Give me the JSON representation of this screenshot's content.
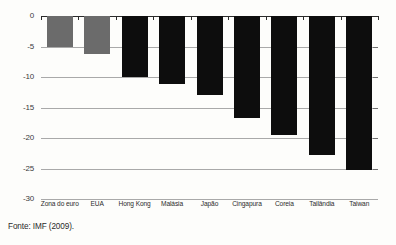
{
  "chart_data": {
    "type": "bar",
    "title": "",
    "subtitle": "",
    "xlabel": "",
    "ylabel": "",
    "ylim": [
      -30,
      0
    ],
    "yticks": [
      0,
      -5,
      -10,
      -15,
      -20,
      -25,
      -30
    ],
    "ytick_labels": [
      "0",
      "-5",
      "-10",
      "-15",
      "-20",
      "-25",
      "-30"
    ],
    "grid": true,
    "legend": false,
    "legend_position": "none",
    "categories": [
      "Zona do euro",
      "EUA",
      "Hong Kong",
      "Malásia",
      "Japão",
      "Cingapura",
      "Coreia",
      "Tailândia",
      "Taiwan"
    ],
    "values": [
      -5.1,
      -6.2,
      -10.0,
      -11.2,
      -13.0,
      -16.8,
      -19.5,
      -22.8,
      -25.3
    ],
    "bar_colors": [
      "#6b6b6b",
      "#6b6b6b",
      "#0d0d0d",
      "#0d0d0d",
      "#0d0d0d",
      "#0d0d0d",
      "#0d0d0d",
      "#0d0d0d",
      "#0d0d0d"
    ]
  },
  "colors": {
    "background": "#fdfdfb",
    "gray_bar": "#6b6b6b",
    "black_bar": "#0d0d0d",
    "gridline": "#a9a9a9",
    "axis": "#2b2b2b",
    "text": "#2b2b2b"
  },
  "footer": {
    "source": "Fonte: IMF (2009)."
  }
}
